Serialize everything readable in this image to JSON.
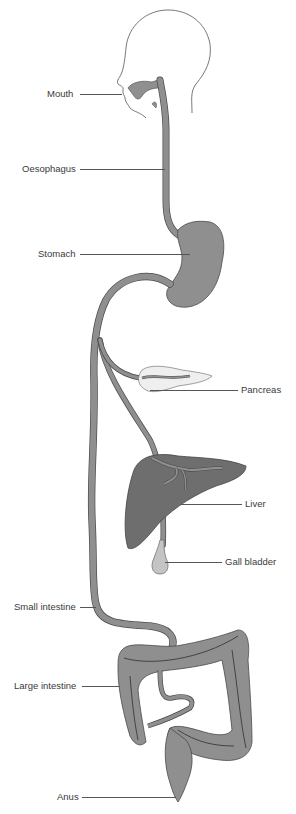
{
  "diagram": {
    "colors": {
      "tract": "#8f8f8f",
      "tract_stroke": "#4a4a4a",
      "liver": "#6e6e6e",
      "pancreas": "#efefef",
      "gall_bladder": "#c4c4c4",
      "outline": "#555555",
      "label_text": "#3a3a3a"
    },
    "labels": [
      {
        "id": "mouth",
        "text": "Mouth",
        "x": 47,
        "y": 88,
        "line_x1": 80,
        "line_x2": 122,
        "line_y": 94
      },
      {
        "id": "oesophagus",
        "text": "Oesophagus",
        "x": 22,
        "y": 163,
        "line_x1": 80,
        "line_x2": 165,
        "line_y": 169
      },
      {
        "id": "stomach",
        "text": "Stomach",
        "x": 38,
        "y": 248,
        "line_x1": 80,
        "line_x2": 190,
        "line_y": 254
      },
      {
        "id": "pancreas",
        "text": "Pancreas",
        "x": 241,
        "y": 384,
        "line_x1": 150,
        "line_x2": 238,
        "line_y": 390
      },
      {
        "id": "liver",
        "text": "Liver",
        "x": 245,
        "y": 498,
        "line_x1": 180,
        "line_x2": 242,
        "line_y": 504
      },
      {
        "id": "gall_bladder",
        "text": "Gall bladder",
        "x": 225,
        "y": 556,
        "line_x1": 165,
        "line_x2": 222,
        "line_y": 562
      },
      {
        "id": "small_intestine",
        "text": "Small intestine",
        "x": 14,
        "y": 601,
        "line_x1": 80,
        "line_x2": 96,
        "line_y": 607
      },
      {
        "id": "large_intestine",
        "text": "Large intestine",
        "x": 14,
        "y": 680,
        "line_x1": 82,
        "line_x2": 120,
        "line_y": 686
      },
      {
        "id": "anus",
        "text": "Anus",
        "x": 57,
        "y": 791,
        "line_x1": 82,
        "line_x2": 176,
        "line_y": 797
      }
    ]
  }
}
